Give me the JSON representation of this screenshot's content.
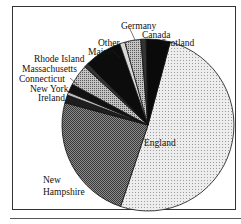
{
  "chart_data": {
    "type": "pie",
    "title": "",
    "start_angle_deg": -75,
    "direction": "clockwise",
    "slices": [
      {
        "label": "England",
        "value": 51.0,
        "fill": "#e6e6e6",
        "pattern": "light-dots"
      },
      {
        "label": "New Hampshire",
        "value": 24.0,
        "fill": "#7a7a7a",
        "pattern": "dense-dots"
      },
      {
        "label": "Ireland",
        "value": 1.5,
        "fill": "#1e1e1e",
        "pattern": "solid-dark"
      },
      {
        "label": "New York",
        "value": 0.6,
        "fill": "#bdbdbd",
        "pattern": "light"
      },
      {
        "label": "Connecticut",
        "value": 1.6,
        "fill": "#111111",
        "pattern": "solid-dark"
      },
      {
        "label": "Massachusetts",
        "value": 4.0,
        "fill": "#a8a8a8",
        "pattern": "medium-dots"
      },
      {
        "label": "Rhode Island",
        "value": 0.8,
        "fill": "#333333",
        "pattern": "dark"
      },
      {
        "label": "Maine",
        "value": 7.0,
        "fill": "#0c0c0c",
        "pattern": "solid-black"
      },
      {
        "label": "Other",
        "value": 1.0,
        "fill": "#d8d8d8",
        "pattern": "light"
      },
      {
        "label": "Germany",
        "value": 3.0,
        "fill": "#6e6e6e",
        "pattern": "medium"
      },
      {
        "label": "Canada",
        "value": 1.0,
        "fill": "#333333",
        "pattern": "dark"
      },
      {
        "label": "Scotland",
        "value": 4.5,
        "fill": "#0a0a0a",
        "pattern": "solid-black"
      }
    ],
    "legend": "none (direct labels)",
    "units": "percent (estimated)"
  },
  "labels": {
    "england": "England",
    "new_hampshire_1": "New",
    "new_hampshire_2": "Hampshire",
    "ireland": "Ireland",
    "new_york": "New York",
    "connecticut": "Connecticut",
    "massachusetts": "Massachusetts",
    "rhode_island": "Rhode Island",
    "maine": "Maine",
    "other": "Other",
    "germany": "Germany",
    "canada": "Canada",
    "scotland": "Scotland"
  }
}
